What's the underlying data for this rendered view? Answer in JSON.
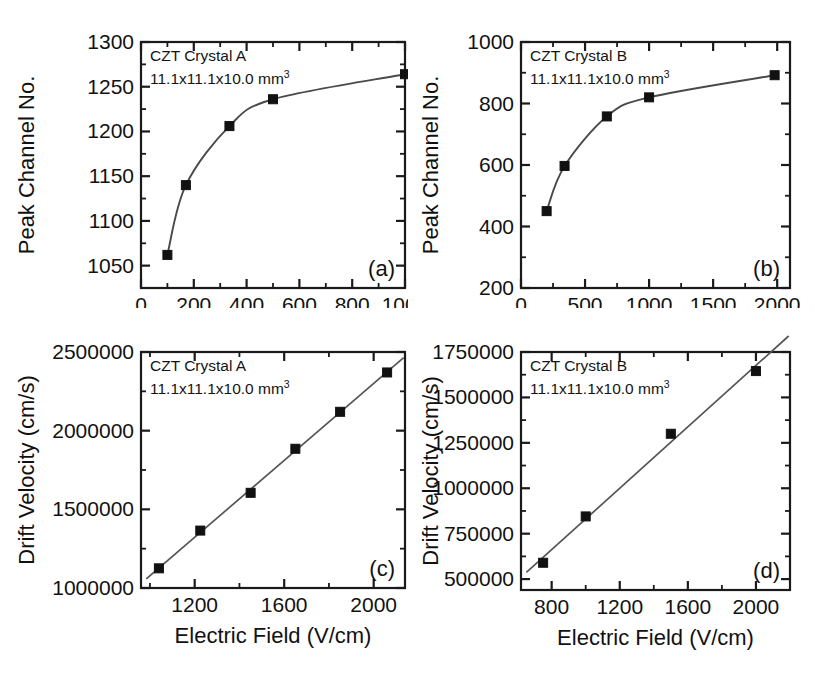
{
  "figure": {
    "background": "#ffffff",
    "axis_color": "#1a1a1a",
    "marker_color": "#111111",
    "line_color": "#4a4a4a"
  },
  "panels": {
    "a": {
      "label": "(a)",
      "annotation_line1": "CZT Crystal A",
      "annotation_line2": "11.1x11.1x10.0 mm",
      "annotation_sup": "3"
    },
    "b": {
      "label": "(b)",
      "annotation_line1": "CZT Crystal B",
      "annotation_line2": "11.1x11.1x10.0 mm",
      "annotation_sup": "3"
    },
    "c": {
      "label": "(c)",
      "annotation_line1": "CZT Crystal A",
      "annotation_line2": "11.1x11.1x10.0 mm",
      "annotation_sup": "3"
    },
    "d": {
      "label": "(d)",
      "annotation_line1": "CZT Crystal B",
      "annotation_line2": "11.1x11.1x10.0 mm",
      "annotation_sup": "3"
    }
  },
  "chart_data": [
    {
      "id": "a",
      "type": "scatter",
      "title": "",
      "xlabel": "Bias (V)",
      "ylabel": "Peak Channel No.",
      "xlim": [
        0,
        1000
      ],
      "ylim": [
        1025,
        1300
      ],
      "xticks": [
        0,
        200,
        400,
        600,
        800,
        1000
      ],
      "xticklabels": [
        "0",
        "200",
        "400",
        "600",
        "800",
        "1000"
      ],
      "xminor_step": 100,
      "yticks": [
        1050,
        1100,
        1150,
        1200,
        1250,
        1300
      ],
      "yticklabels": [
        "1050",
        "1100",
        "1150",
        "1200",
        "1250",
        "1300"
      ],
      "yminor_step": 25,
      "grid": false,
      "legend": "none",
      "x": [
        100,
        170,
        335,
        500,
        1000
      ],
      "y": [
        1062,
        1140,
        1206,
        1236,
        1264
      ],
      "fit": "saturating curve through points"
    },
    {
      "id": "b",
      "type": "scatter",
      "title": "",
      "xlabel": "Bias (V)",
      "ylabel": "Peak Channel No.",
      "xlim": [
        0,
        2100
      ],
      "ylim": [
        200,
        1000
      ],
      "xticks": [
        0,
        500,
        1000,
        1500,
        2000
      ],
      "xticklabels": [
        "0",
        "500",
        "1000",
        "1500",
        "2000"
      ],
      "xminor_step": 250,
      "yticks": [
        200,
        400,
        600,
        800,
        1000
      ],
      "yticklabels": [
        "200",
        "400",
        "600",
        "800",
        "1000"
      ],
      "yminor_step": 100,
      "grid": false,
      "legend": "none",
      "x": [
        200,
        340,
        670,
        1000,
        1980
      ],
      "y": [
        450,
        597,
        758,
        820,
        892
      ],
      "fit": "saturating curve through points"
    },
    {
      "id": "c",
      "type": "scatter",
      "title": "",
      "xlabel": "Electric Field (V/cm)",
      "ylabel": "Drift Velocity (cm/s)",
      "xlim": [
        960,
        2140
      ],
      "ylim": [
        1000000,
        2500000
      ],
      "xticks": [
        1200,
        1600,
        2000
      ],
      "xticklabels": [
        "1200",
        "1600",
        "2000"
      ],
      "xminor_step": 200,
      "yticks": [
        1000000,
        1500000,
        2000000,
        2500000
      ],
      "yticklabels": [
        "1000000",
        "1500000",
        "2000000",
        "2500000"
      ],
      "yminor_step": 250000,
      "grid": false,
      "legend": "none",
      "x": [
        1040,
        1225,
        1450,
        1650,
        1850,
        2060
      ],
      "y": [
        1125000,
        1365000,
        1605000,
        1885000,
        2120000,
        2370000
      ],
      "fit": "linear"
    },
    {
      "id": "d",
      "type": "scatter",
      "title": "",
      "xlabel": "Electric Field (V/cm)",
      "ylabel": "Drift Velocity (cm/s)",
      "xlim": [
        620,
        2200
      ],
      "ylim": [
        440000,
        1750000
      ],
      "xticks": [
        800,
        1200,
        1600,
        2000
      ],
      "xticklabels": [
        "800",
        "1200",
        "1600",
        "2000"
      ],
      "xminor_step": 200,
      "yticks": [
        500000,
        750000,
        1000000,
        1250000,
        1500000,
        1750000
      ],
      "yticklabels": [
        "500000",
        "750000",
        "1000000",
        "1250000",
        "1500000",
        "1750000"
      ],
      "yminor_step": 125000,
      "grid": false,
      "legend": "none",
      "x": [
        750,
        1000,
        1500,
        2000
      ],
      "y": [
        590000,
        845000,
        1300000,
        1645000
      ],
      "fit": "linear"
    }
  ]
}
